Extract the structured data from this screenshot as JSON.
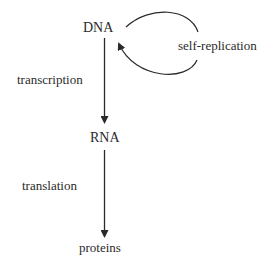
{
  "diagram": {
    "nodes": [
      {
        "id": "dna",
        "label": "DNA"
      },
      {
        "id": "rna",
        "label": "RNA"
      },
      {
        "id": "proteins",
        "label": "proteins"
      }
    ],
    "edges": [
      {
        "from": "dna",
        "to": "dna",
        "label": "self-replication"
      },
      {
        "from": "dna",
        "to": "rna",
        "label": "transcription"
      },
      {
        "from": "rna",
        "to": "proteins",
        "label": "translation"
      }
    ],
    "colors": {
      "stroke": "#2a2a2a",
      "text": "#2a2a2a",
      "background": "#ffffff"
    }
  }
}
